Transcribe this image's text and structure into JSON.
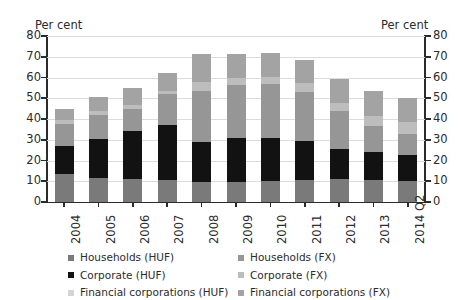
{
  "chart_data": {
    "type": "bar",
    "stacked": true,
    "title": "",
    "subtitle": "",
    "xlabel": "",
    "ylabel": "Per cent",
    "ylabel_right": "Per cent",
    "ylim": [
      0,
      80
    ],
    "yticks": [
      0,
      10,
      20,
      30,
      40,
      50,
      60,
      70,
      80
    ],
    "grid": true,
    "legend_position": "bottom",
    "categories": [
      "2004",
      "2005",
      "2006",
      "2007",
      "2008",
      "2009",
      "2010",
      "2011",
      "2012",
      "2013",
      "2014 Q2"
    ],
    "series": [
      {
        "name": "Households (HUF)",
        "color": "#7a7a7a",
        "values": [
          13.5,
          11.5,
          11.0,
          10.5,
          9.5,
          9.5,
          10.0,
          10.5,
          11.0,
          10.5,
          10.0
        ]
      },
      {
        "name": "Corporate (HUF)",
        "color": "#121212",
        "values": [
          13.5,
          19.0,
          23.0,
          26.5,
          19.5,
          21.5,
          21.0,
          19.0,
          14.5,
          13.5,
          12.5
        ]
      },
      {
        "name": "Financial corporations (HUF)",
        "color": "#d4d4d4",
        "values": [
          0.0,
          0.0,
          0.0,
          0.0,
          0.0,
          0.0,
          0.0,
          0.0,
          0.0,
          0.0,
          0.0
        ]
      },
      {
        "name": "Households (FX)",
        "color": "#969696",
        "values": [
          10.5,
          11.5,
          11.0,
          15.0,
          24.5,
          25.5,
          26.0,
          23.5,
          18.5,
          12.5,
          10.5
        ]
      },
      {
        "name": "Corporate (FX)",
        "color": "#bdbdbd",
        "values": [
          2.0,
          2.0,
          2.0,
          1.5,
          4.5,
          3.5,
          3.5,
          4.5,
          3.5,
          5.0,
          5.5
        ]
      },
      {
        "name": "Financial corporations (FX)",
        "color": "#a3a3a3",
        "values": [
          5.5,
          6.5,
          8.0,
          8.5,
          13.5,
          11.5,
          11.5,
          11.0,
          12.0,
          12.0,
          11.5
        ]
      }
    ],
    "totals": [
      45.0,
      50.5,
      55.0,
      62.0,
      71.5,
      71.5,
      72.0,
      68.5,
      59.5,
      53.5,
      50.0
    ]
  },
  "axes": {
    "unit_left": "Per cent",
    "unit_right": "Per cent",
    "ytick_labels": [
      "80",
      "70",
      "60",
      "50",
      "40",
      "30",
      "20",
      "10",
      "0"
    ],
    "xtick_labels": [
      "2004",
      "2005",
      "2006",
      "2007",
      "2008",
      "2009",
      "2010",
      "2011",
      "2012",
      "2013",
      "2014 Q2"
    ]
  },
  "legend": {
    "column_left": [
      {
        "label": "Households (HUF)",
        "color": "#7a7a7a"
      },
      {
        "label": "Corporate (HUF)",
        "color": "#121212"
      },
      {
        "label": "Financial corporations (HUF)",
        "color": "#d4d4d4"
      }
    ],
    "column_right": [
      {
        "label": "Households (FX)",
        "color": "#969696"
      },
      {
        "label": "Corporate (FX)",
        "color": "#bdbdbd"
      },
      {
        "label": "Financial corporations (FX)",
        "color": "#a3a3a3"
      }
    ]
  }
}
